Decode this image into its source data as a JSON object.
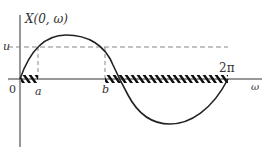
{
  "diagram": {
    "y_axis_label": "X(0, ω)",
    "x_axis_label": "ω",
    "origin_label": "0",
    "level_label": "u",
    "tick_labels": [
      "a",
      "b",
      "2π"
    ],
    "curve": "one period of a sine-like function from 0 to 2π",
    "hatched_intervals": [
      [
        "0",
        "a"
      ],
      [
        "b",
        "2π"
      ]
    ],
    "colors": {
      "line": "#222222",
      "dashed": "#888888"
    }
  }
}
